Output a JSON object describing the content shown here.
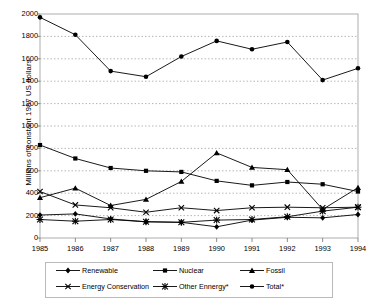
{
  "chart_data": {
    "type": "line",
    "title": "",
    "subtitle": "",
    "xlabel": "",
    "ylabel": "Millions of constant 1987 US dollars",
    "categories": [
      "1985",
      "1986",
      "1987",
      "1988",
      "1989",
      "1990",
      "1991",
      "1992",
      "1993",
      "1994"
    ],
    "x": [
      1985,
      1986,
      1987,
      1988,
      1989,
      1990,
      1991,
      1992,
      1993,
      1994
    ],
    "ylim": [
      0,
      2000
    ],
    "ytick_labels": [
      "0",
      "200",
      "400",
      "600",
      "800",
      "1000",
      "1200",
      "1400",
      "1600",
      "1800",
      "2000"
    ],
    "yticks": [
      0,
      200,
      400,
      600,
      800,
      1000,
      1200,
      1400,
      1600,
      1800,
      2000
    ],
    "grid": true,
    "grid_axis": "y",
    "legend_position": "bottom",
    "series": [
      {
        "name": "Renewable",
        "marker": "diamond",
        "color": "#000000",
        "values": [
          205,
          215,
          170,
          145,
          140,
          100,
          160,
          185,
          180,
          210
        ]
      },
      {
        "name": "Nuclear",
        "marker": "square",
        "color": "#000000",
        "values": [
          830,
          710,
          625,
          600,
          590,
          510,
          470,
          500,
          480,
          415
        ]
      },
      {
        "name": "Fossil",
        "marker": "triangle",
        "color": "#000000",
        "values": [
          360,
          445,
          290,
          345,
          505,
          760,
          630,
          610,
          255,
          450
        ]
      },
      {
        "name": "Energy Conservation",
        "marker": "x",
        "color": "#000000",
        "values": [
          415,
          295,
          270,
          230,
          270,
          245,
          270,
          275,
          270,
          275
        ]
      },
      {
        "name": "Other Ennergy*",
        "marker": "star",
        "color": "#000000",
        "values": [
          165,
          150,
          165,
          145,
          140,
          160,
          165,
          190,
          240,
          275
        ]
      },
      {
        "name": "Total*",
        "marker": "circle",
        "color": "#000000",
        "values": [
          1970,
          1815,
          1490,
          1440,
          1620,
          1760,
          1685,
          1750,
          1410,
          1515
        ]
      }
    ]
  },
  "legend": {
    "entries": [
      {
        "label": "Renewable"
      },
      {
        "label": "Nuclear"
      },
      {
        "label": "Fossil"
      },
      {
        "label": "Energy Conservation"
      },
      {
        "label": "Other Ennergy*"
      },
      {
        "label": "Total*"
      }
    ]
  }
}
